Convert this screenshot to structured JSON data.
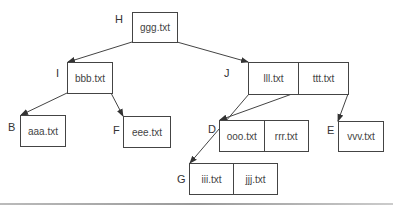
{
  "diagram": {
    "type": "b-tree",
    "nodes": {
      "H": {
        "label": "H",
        "keys": [
          "ggg.txt"
        ]
      },
      "I": {
        "label": "I",
        "keys": [
          "bbb.txt"
        ]
      },
      "J": {
        "label": "J",
        "keys": [
          "lll.txt",
          "ttt.txt"
        ]
      },
      "B": {
        "label": "B",
        "keys": [
          "aaa.txt"
        ]
      },
      "F": {
        "label": "F",
        "keys": [
          "eee.txt"
        ]
      },
      "D": {
        "label": "D",
        "keys": [
          "ooo.txt",
          "rrr.txt"
        ]
      },
      "E": {
        "label": "E",
        "keys": [
          "vvv.txt"
        ]
      },
      "G": {
        "label": "G",
        "keys": [
          "iii.txt",
          "jjj.txt"
        ]
      }
    },
    "edges": [
      {
        "from": "H",
        "to": "I"
      },
      {
        "from": "H",
        "to": "J"
      },
      {
        "from": "I",
        "to": "B"
      },
      {
        "from": "I",
        "to": "F"
      },
      {
        "from": "J",
        "to": "G"
      },
      {
        "from": "J",
        "to": "D"
      },
      {
        "from": "J",
        "to": "E"
      }
    ],
    "colors": {
      "stroke": "#444444",
      "text": "#333333",
      "background": "#ffffff"
    }
  }
}
